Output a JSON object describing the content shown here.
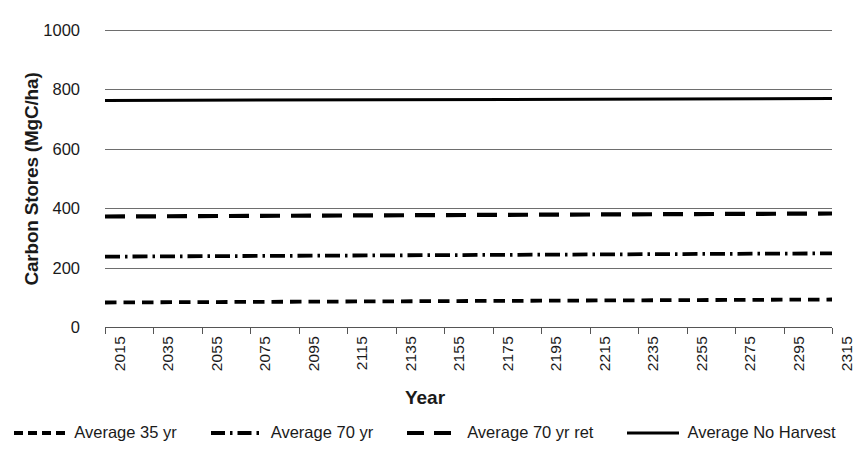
{
  "chart_data": {
    "type": "line",
    "title": "",
    "xlabel": "Year",
    "ylabel": "Carbon Stores (MgC/ha)",
    "xlim": [
      2015,
      2315
    ],
    "ylim": [
      0,
      1000
    ],
    "ytick_values": [
      0,
      200,
      400,
      600,
      800,
      1000
    ],
    "ytick_labels": [
      "0",
      "200",
      "400",
      "600",
      "800",
      "1000"
    ],
    "xtick_labels": [
      "2015",
      "2035",
      "2055",
      "2075",
      "2095",
      "2115",
      "2135",
      "2155",
      "2175",
      "2195",
      "2215",
      "2235",
      "2255",
      "2275",
      "2295",
      "2315"
    ],
    "x": [
      2015,
      2315
    ],
    "grid": "horizontal",
    "legend_position": "bottom",
    "series": [
      {
        "name": "Average 35 yr",
        "style": "shortdash",
        "values": [
          88,
          98
        ],
        "start": 88,
        "end": 98
      },
      {
        "name": "Average 70 yr",
        "style": "dashdot",
        "values": [
          242,
          253
        ],
        "start": 242,
        "end": 253
      },
      {
        "name": "Average 70 yr ret",
        "style": "longdash",
        "values": [
          379,
          389
        ],
        "start": 379,
        "end": 389
      },
      {
        "name": "Average No Harvest",
        "style": "solid",
        "values": [
          768,
          775
        ],
        "start": 768,
        "end": 775
      }
    ]
  },
  "axes": {
    "y_title": "Carbon Stores (MgC/ha)",
    "x_title": "Year",
    "y_labels": [
      "1000",
      "800",
      "600",
      "400",
      "200",
      "0"
    ],
    "x_labels": [
      "2015",
      "2035",
      "2055",
      "2075",
      "2095",
      "2115",
      "2135",
      "2155",
      "2175",
      "2195",
      "2215",
      "2235",
      "2255",
      "2275",
      "2295",
      "2315"
    ]
  },
  "legend": {
    "items": [
      {
        "label": "Average 35 yr",
        "style": "shortdash"
      },
      {
        "label": "Average 70 yr",
        "style": "dashdot"
      },
      {
        "label": "Average 70 yr ret",
        "style": "longdash"
      },
      {
        "label": "Average No Harvest",
        "style": "solid"
      }
    ]
  },
  "colors": {
    "line": "#000000",
    "gridline": "#6e6e6e",
    "text": "#1a1a1a",
    "background": "#ffffff"
  }
}
